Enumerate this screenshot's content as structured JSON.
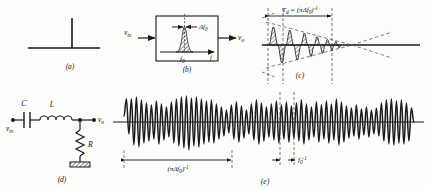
{
  "figure": {
    "background_color": "#fdfdfb",
    "ink_color": "#1a1a1a"
  },
  "panels": [
    {
      "id": "a",
      "letter": "(a)",
      "name": "impulse-input",
      "description": "Unit impulse (delta function) drawn as a vertical spike on a horizontal baseline"
    },
    {
      "id": "b",
      "letter": "(b)",
      "name": "filter-block-frequency-response",
      "input_label": "v_in",
      "output_label": "v_o",
      "axis_label": "f",
      "center_frequency_label": "f_0",
      "bandwidth_label": "Δf_0",
      "description": "Block containing a narrow hatched resonance peak centered at f0 with bandwidth arrows"
    },
    {
      "id": "c",
      "letter": "(c)",
      "name": "damped-impulse-response",
      "dimension_label": "T_d = (πΔf_0)⁻¹",
      "description": "Decaying sinusoid with hatched lobes inside a dashed triangular envelope"
    },
    {
      "id": "d",
      "letter": "(d)",
      "name": "rlc-circuit",
      "input_label": "v_in",
      "output_label": "v_o",
      "components": [
        {
          "symbol": "C",
          "type": "capacitor"
        },
        {
          "symbol": "L",
          "type": "inductor"
        },
        {
          "symbol": "R",
          "type": "resistor"
        }
      ],
      "ground": true,
      "description": "Series C and L from v_in to output node, shunt R to ground"
    },
    {
      "id": "e",
      "letter": "(e)",
      "name": "noise-output-waveform",
      "dimension_labels": [
        "(πΔf_0)⁻¹",
        "f_0⁻¹"
      ],
      "description": "Long randomly amplitude-modulated oscillation showing correlation time and carrier period"
    }
  ],
  "symbols": {
    "v_in": "v",
    "v_in_sub": "in",
    "v_o": "v",
    "v_o_sub": "o",
    "f": "f",
    "f0": "f",
    "f0_sub": "0",
    "delta_f0": "Δf",
    "delta_f0_sub": "0",
    "Td": "T",
    "Td_sub": "d",
    "C": "C",
    "L": "L",
    "R": "R"
  }
}
